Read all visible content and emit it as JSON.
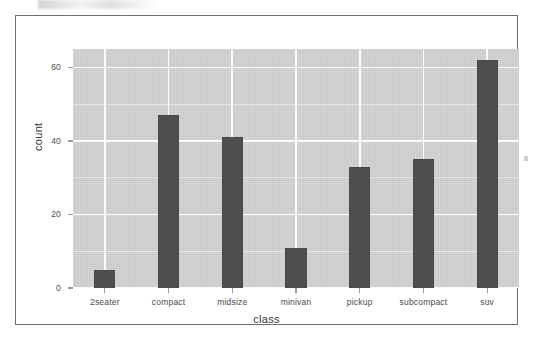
{
  "chart_data": {
    "type": "bar",
    "title": "",
    "subtitle": "",
    "xlabel": "class",
    "ylabel": "count",
    "categories": [
      "2seater",
      "compact",
      "midsize",
      "minivan",
      "pickup",
      "subcompact",
      "suv"
    ],
    "values": [
      5,
      47,
      41,
      11,
      33,
      35,
      62
    ],
    "ylim": [
      0,
      65
    ],
    "y_ticks": [
      0,
      20,
      40,
      60
    ],
    "y_tick_labels": [
      "0",
      "20",
      "40",
      "60"
    ],
    "grid": "major-and-minor-white-on-grey",
    "legend": "none",
    "bar_color": "#4e4e4e",
    "panel_background": "#d4d4d4",
    "gridline_color": "#fbfbfb",
    "frame_color": "#6e6e6e"
  },
  "axes": {
    "x_title": "class",
    "y_title": "count"
  }
}
